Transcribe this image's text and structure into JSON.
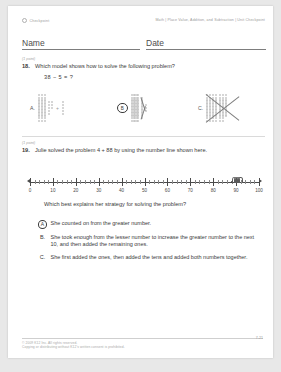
{
  "header": {
    "left_label": "Checkpoint",
    "left_icon": "circle-checkpoint-icon",
    "breadcrumb": "Math | Place Value, Addition, and Subtraction | Unit Checkpoint"
  },
  "name_date": {
    "name_label": "Name",
    "date_label": "Date"
  },
  "questions": [
    {
      "points": "(1 point)",
      "number": "18.",
      "prompt": "Which model shows how to solve the following problem?",
      "expression": "38 − 5 = ?",
      "choices": [
        {
          "letter": "A.",
          "selected": false,
          "kind": "addition-model"
        },
        {
          "letter": "B",
          "selected": true,
          "kind": "cross-out-columns-model"
        },
        {
          "letter": "C.",
          "selected": false,
          "kind": "cross-out-block-model"
        }
      ]
    },
    {
      "points": "(1 point)",
      "number": "19.",
      "prompt": "Julie solved the problem 4 + 88 by using the number line shown here.",
      "stem": "Which best explains her strategy for solving the problem?",
      "choices": [
        {
          "letter": "A",
          "selected": true,
          "text": "She counted on from the greater number."
        },
        {
          "letter": "B.",
          "selected": false,
          "text": "She took enough from the lesser number to increase the greater number to the next 10, and then added the remaining ones."
        },
        {
          "letter": "C.",
          "selected": false,
          "text": "She first added the ones, then added the tens and added both numbers together."
        }
      ]
    }
  ],
  "chart_data": {
    "type": "number-line",
    "title": "",
    "xlabel": "",
    "xlim": [
      0,
      100
    ],
    "major_tick_step": 10,
    "minor_tick_step": 2,
    "tick_labels": [
      "0",
      "10",
      "20",
      "30",
      "40",
      "50",
      "60",
      "70",
      "80",
      "90",
      "100"
    ],
    "tick_values": [
      0,
      10,
      20,
      30,
      40,
      50,
      60,
      70,
      80,
      90,
      100
    ],
    "start_point": 88,
    "hops": [
      {
        "from": 88,
        "to": 89
      },
      {
        "from": 89,
        "to": 90
      },
      {
        "from": 90,
        "to": 91
      },
      {
        "from": 91,
        "to": 92
      }
    ],
    "annotation": "4 counted-on hops from 88 to 92"
  },
  "footer": {
    "copyright_line1": "© 2009 K12 Inc. All rights reserved.",
    "copyright_line2": "Copying or distributing without K12's written consent is prohibited.",
    "page_number": "7-21"
  }
}
